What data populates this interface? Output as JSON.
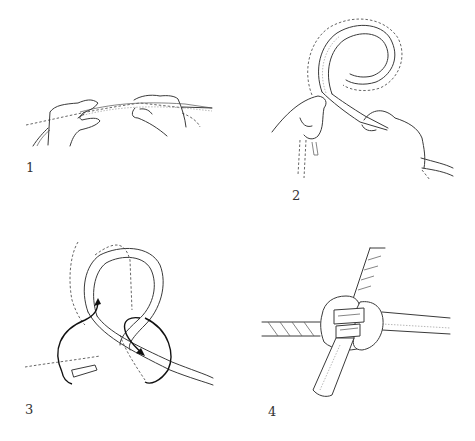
{
  "figure": {
    "title": "",
    "steps": [
      {
        "number": "1",
        "description": "Two hands holding rope ends overlapped"
      },
      {
        "number": "2",
        "description": "Rope formed into a loop, held by left hand, right hand guiding the end"
      },
      {
        "number": "3",
        "description": "Loop with arrows showing the end passing through"
      },
      {
        "number": "4",
        "description": "Completed knot joining two ropes"
      }
    ]
  }
}
